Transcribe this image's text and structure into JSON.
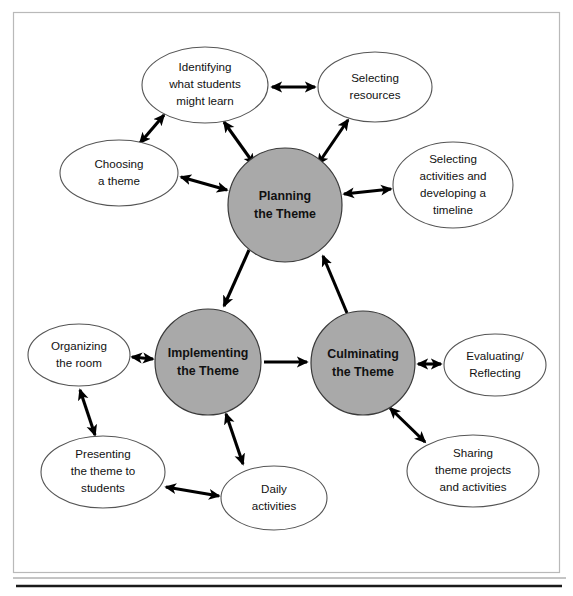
{
  "diagram": {
    "colors": {
      "core_fill": "#a9a9a9",
      "satellite_fill": "#ffffff",
      "stroke": "#000000",
      "frame": "#b9b9b9"
    },
    "core_nodes": [
      {
        "id": "planning",
        "label_line1": "Planning",
        "label_line2": "the Theme",
        "cx": 285,
        "cy": 205,
        "r": 57
      },
      {
        "id": "implementing",
        "label_line1": "Implementing",
        "label_line2": "the Theme",
        "cx": 208,
        "cy": 362,
        "r": 53
      },
      {
        "id": "culminating",
        "label_line1": "Culminating",
        "label_line2": "the Theme",
        "cx": 363,
        "cy": 363,
        "r": 52
      }
    ],
    "satellite_nodes": [
      {
        "id": "identifying",
        "lines": [
          "Identifying",
          "what students",
          "might learn"
        ],
        "cx": 205,
        "cy": 85,
        "rx": 63,
        "ry": 38
      },
      {
        "id": "selecting-resources",
        "lines": [
          "Selecting",
          "resources"
        ],
        "cx": 375,
        "cy": 87,
        "rx": 57,
        "ry": 35
      },
      {
        "id": "choosing-theme",
        "lines": [
          "Choosing",
          "a theme"
        ],
        "cx": 119,
        "cy": 173,
        "rx": 59,
        "ry": 33
      },
      {
        "id": "selecting-activities",
        "lines": [
          "Selecting",
          "activities and",
          "developing a",
          "timeline"
        ],
        "cx": 453,
        "cy": 185,
        "rx": 60,
        "ry": 43
      },
      {
        "id": "organizing-room",
        "lines": [
          "Organizing",
          "the room"
        ],
        "cx": 79,
        "cy": 355,
        "rx": 51,
        "ry": 31
      },
      {
        "id": "evaluating",
        "lines": [
          "Evaluating/",
          "Reflecting"
        ],
        "cx": 495,
        "cy": 365,
        "rx": 51,
        "ry": 31
      },
      {
        "id": "presenting",
        "lines": [
          "Presenting",
          "the theme to",
          "students"
        ],
        "cx": 103,
        "cy": 472,
        "rx": 62,
        "ry": 36
      },
      {
        "id": "daily-activities",
        "lines": [
          "Daily",
          "activities"
        ],
        "cx": 274,
        "cy": 498,
        "rx": 53,
        "ry": 32
      },
      {
        "id": "sharing",
        "lines": [
          "Sharing",
          "theme projects",
          "and activities"
        ],
        "cx": 473,
        "cy": 471,
        "rx": 66,
        "ry": 36
      }
    ],
    "connections": [
      {
        "from": "planning",
        "to": "implementing",
        "type": "single"
      },
      {
        "from": "culminating",
        "to": "planning",
        "type": "single"
      },
      {
        "from": "implementing",
        "to": "culminating",
        "type": "single"
      },
      {
        "from": "identifying",
        "to": "selecting-resources",
        "type": "double"
      },
      {
        "from": "identifying",
        "to": "choosing-theme",
        "type": "double"
      },
      {
        "from": "identifying",
        "to": "planning",
        "type": "double"
      },
      {
        "from": "selecting-resources",
        "to": "planning",
        "type": "double"
      },
      {
        "from": "choosing-theme",
        "to": "planning",
        "type": "double"
      },
      {
        "from": "selecting-activities",
        "to": "planning",
        "type": "double"
      },
      {
        "from": "organizing-room",
        "to": "implementing",
        "type": "double"
      },
      {
        "from": "presenting",
        "to": "organizing-room",
        "type": "double"
      },
      {
        "from": "presenting",
        "to": "daily-activities",
        "type": "double"
      },
      {
        "from": "daily-activities",
        "to": "implementing",
        "type": "double"
      },
      {
        "from": "evaluating",
        "to": "culminating",
        "type": "double"
      },
      {
        "from": "sharing",
        "to": "culminating",
        "type": "double"
      }
    ]
  }
}
